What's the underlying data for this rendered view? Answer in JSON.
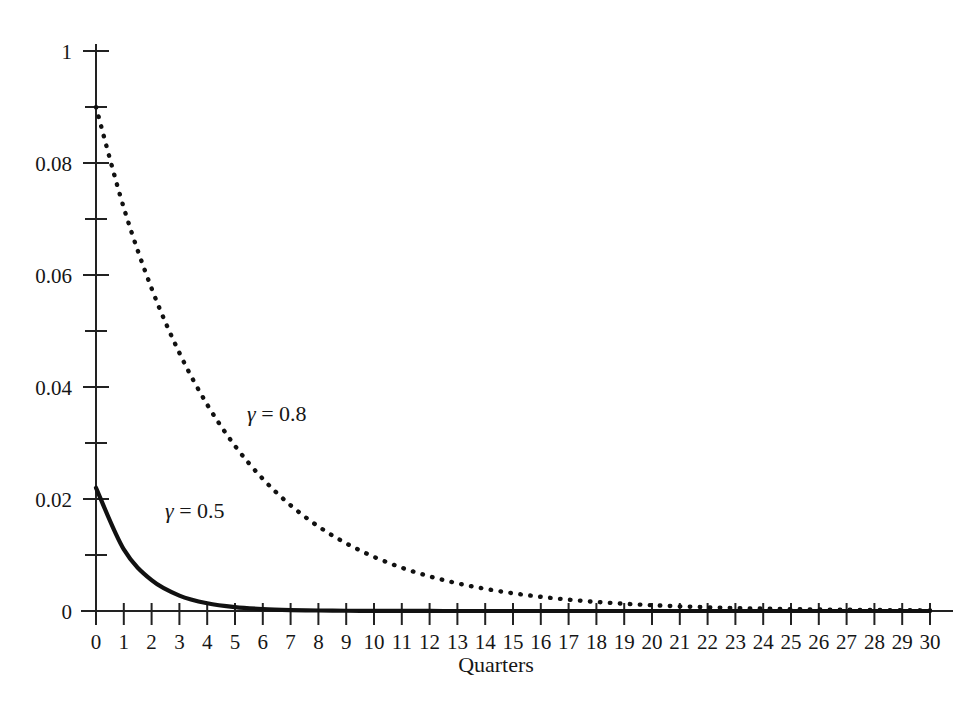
{
  "chart_data": {
    "type": "line",
    "title": "",
    "xlabel": "Quarters",
    "ylabel": "",
    "xlim": [
      0,
      30
    ],
    "ylim": [
      0,
      0.1
    ],
    "grid": false,
    "legend_position": "inline-annotation",
    "x": [
      0,
      1,
      2,
      3,
      4,
      5,
      6,
      7,
      8,
      9,
      10,
      11,
      12,
      13,
      14,
      15,
      16,
      17,
      18,
      19,
      20,
      21,
      22,
      23,
      24,
      25,
      26,
      27,
      28,
      29,
      30
    ],
    "x_tick_labels": [
      "0",
      "1",
      "2",
      "3",
      "4",
      "5",
      "6",
      "7",
      "8",
      "9",
      "10",
      "11",
      "12",
      "13",
      "14",
      "15",
      "16",
      "17",
      "18",
      "19",
      "20",
      "21",
      "22",
      "23",
      "24",
      "25",
      "26",
      "27",
      "28",
      "29",
      "30"
    ],
    "y_tick_labels": [
      "1",
      "0.08",
      "0.06",
      "0.04",
      "0.02",
      "0"
    ],
    "y_tick_values": [
      0.1,
      0.08,
      0.06,
      0.04,
      0.02,
      0
    ],
    "y_minor_tick_values": [
      0.09,
      0.07,
      0.05,
      0.03,
      0.01
    ],
    "series": [
      {
        "name": "gamma = 0.8",
        "label": "γ = 0.8",
        "gamma": 0.8,
        "style": "dotted",
        "color": "#111111",
        "values": [
          0.09,
          0.072,
          0.0576,
          0.04608,
          0.036864,
          0.0294912,
          0.02359296,
          0.018874368,
          0.015099494,
          0.012079595,
          0.009663676,
          0.007730941,
          0.006184753,
          0.004947802,
          0.003958242,
          0.003166594,
          0.002533275,
          0.00202662,
          0.001621296,
          0.001297037,
          0.001037629,
          0.000830104,
          0.000664083,
          0.000531266,
          0.000425013,
          0.00034001,
          0.000272008,
          0.000217607,
          0.000174085,
          0.000139268,
          0.000111415
        ]
      },
      {
        "name": "gamma = 0.5",
        "label": "γ = 0.5",
        "gamma": 0.5,
        "style": "solid",
        "color": "#111111",
        "values": [
          0.022,
          0.011,
          0.0055,
          0.00275,
          0.001375,
          0.0006875,
          0.00034375,
          0.000171875,
          8.59375e-05,
          4.296875e-05,
          2.1484375e-05,
          1.07421875e-05,
          5.37109375e-06,
          2.685546875e-06,
          1.3427734375e-06,
          6.7138671875e-07,
          3.35693359375e-07,
          1.678466796875e-07,
          8.392333984375e-08,
          4.1961669921875e-08,
          2.09808349609375e-08,
          1.049041748046875e-08,
          5.245208740234375e-09,
          2.6226043701171873e-09,
          1.3113021850585939e-09,
          6.556510925292969e-10,
          3.278255462646484e-10,
          1.639127731323242e-10,
          8.19563865661621e-11,
          4.097819328308105e-11,
          2.0489096641540526e-11
        ]
      }
    ],
    "annotations": [
      {
        "text": "γ = 0.8",
        "x_px": 247,
        "y_px": 421
      },
      {
        "text": "γ = 0.5",
        "x_px": 165,
        "y_px": 518
      }
    ]
  },
  "figure": {
    "background_color": "#ffffff",
    "axis_color": "#222222",
    "text_color": "#161616"
  }
}
